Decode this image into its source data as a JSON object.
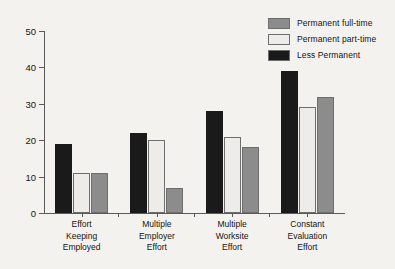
{
  "chart_data": {
    "type": "bar",
    "title": "",
    "subtitle": "",
    "xlabel": "",
    "ylabel": "",
    "ylim": [
      0,
      50
    ],
    "yticks": [
      0,
      10,
      20,
      30,
      40,
      50
    ],
    "grid": false,
    "legend_position": "top-right",
    "categories": [
      "Effort\nKeeping\nEmployed",
      "Multiple\nEmployer\nEffort",
      "Multiple\nWorksite\nEffort",
      "Constant\nEvaluation\nEffort"
    ],
    "category_lines": [
      [
        "Effort",
        "Keeping",
        "Employed"
      ],
      [
        "Multiple",
        "Employer",
        "Effort"
      ],
      [
        "Multiple",
        "Worksite",
        "Effort"
      ],
      [
        "Constant",
        "Evaluation",
        "Effort"
      ]
    ],
    "series": [
      {
        "name": "Less Permanent",
        "color": "#1a1a1a",
        "values": [
          19,
          22,
          28,
          39
        ]
      },
      {
        "name": "Permanent part-time",
        "color": "#eeece8",
        "values": [
          11,
          20,
          21,
          29
        ]
      },
      {
        "name": "Permanent full-time",
        "color": "#8c8c8c",
        "values": [
          11,
          7,
          18,
          32
        ]
      }
    ],
    "legend_entries": [
      {
        "label": "Permanent full-time",
        "color": "#8c8c8c"
      },
      {
        "label": "Permanent part-time",
        "color": "#eeece8"
      },
      {
        "label": "Less Permanent",
        "color": "#1a1a1a"
      }
    ]
  }
}
